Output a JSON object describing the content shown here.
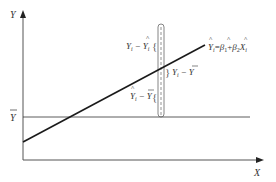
{
  "diagram": {
    "type": "regression-decomposition",
    "axes": {
      "y_label": "Y",
      "x_label": "X"
    },
    "mean_line": {
      "label": "Y",
      "label_decoration": "bar",
      "meaning": "sample mean of Y"
    },
    "regression_line": {
      "equation": {
        "lhs": "Y",
        "lhs_sub": "i",
        "eq": "=",
        "b1": "β",
        "b1_sub": "1",
        "plus": "+",
        "b2": "β",
        "b2_sub": "2",
        "x": "X",
        "x_sub": "i"
      }
    },
    "annotations": {
      "residual": {
        "a": "Y",
        "a_sub": "i",
        "minus": "−",
        "b": "Y",
        "b_sub": "i",
        "b_decoration": "hat"
      },
      "total": {
        "a": "Y",
        "a_sub": "i",
        "minus": "−",
        "b": "Y",
        "b_decoration": "bar"
      },
      "explained": {
        "a": "Y",
        "a_sub": "i",
        "a_decoration": "hat",
        "minus": "−",
        "b": "Y",
        "b_decoration": "bar"
      }
    },
    "colors": {
      "axis": "#555555",
      "regression_line": "#1a1a1a",
      "mean_line": "#333333",
      "tube": "#666666",
      "text": "#333333"
    }
  }
}
